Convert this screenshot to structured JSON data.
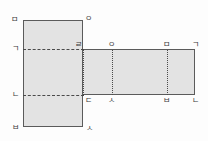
{
  "figure": {
    "fill_color": "#e3e3e3",
    "line_color": "#5b5b5b",
    "fold_line_color": "#4a4a4a",
    "background_color": "#fdfdfd"
  },
  "faces": [
    {
      "name": "left-panel",
      "x": 23,
      "y": 20,
      "width": 60,
      "height": 107
    },
    {
      "name": "right-strip",
      "x": 83,
      "y": 49,
      "width": 112,
      "height": 46
    }
  ],
  "fold_lines": [
    {
      "name": "fold-top",
      "orientation": "horizontal",
      "style": "dashed",
      "position": 49
    },
    {
      "name": "fold-bottom",
      "orientation": "horizontal",
      "style": "dashed",
      "position": 95
    },
    {
      "name": "fold-shared",
      "orientation": "vertical",
      "style": "dotted",
      "position": 83
    },
    {
      "name": "fold-v1",
      "orientation": "vertical",
      "style": "dotted",
      "position": 112
    },
    {
      "name": "fold-v2",
      "orientation": "vertical",
      "style": "dotted",
      "position": 167
    }
  ],
  "labels": {
    "top_left": "ㅁ",
    "top_right": "ㅇ",
    "mid_left": "ㄱ",
    "mid_shared": "ㄹ",
    "mid_v1": "ㅇ",
    "mid_v2": "ㅁ",
    "mid_right": "ㄱ",
    "lower_left": "ㄴ",
    "lower_shared": "ㄷ",
    "lower_v1": "ㅅ",
    "lower_v2": "ㅂ",
    "lower_right": "ㄴ",
    "bottom_left": "ㅂ",
    "bottom_right": "ㅅ"
  }
}
